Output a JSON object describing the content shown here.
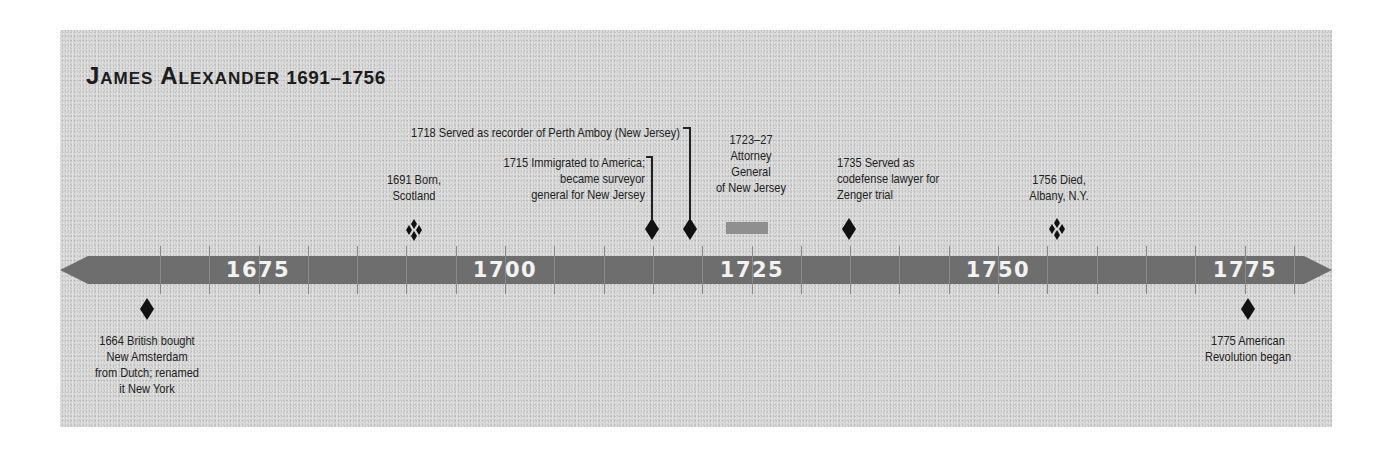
{
  "title": {
    "name": "James Alexander",
    "years": "1691–1756"
  },
  "axis": {
    "labels": [
      {
        "year": 1675,
        "text": "1675",
        "x": 258
      },
      {
        "year": 1700,
        "text": "1700",
        "x": 505
      },
      {
        "year": 1725,
        "text": "1725",
        "x": 752
      },
      {
        "year": 1750,
        "text": "1750",
        "x": 998
      },
      {
        "year": 1775,
        "text": "1775",
        "x": 1245
      }
    ],
    "tick_interval_years": 5,
    "bar_color": "#6e6e6e",
    "range": [
      1660,
      1780
    ]
  },
  "events": {
    "e1664": {
      "text_lines": [
        "1664 British bought",
        "New Amsterdam",
        "from Dutch; renamed",
        "it New York"
      ],
      "year": "1664",
      "marker": "diamond",
      "position": "below"
    },
    "e1691": {
      "text_lines": [
        "1691 Born,",
        "Scotland"
      ],
      "year": "1691",
      "marker": "diamond-cluster",
      "position": "above"
    },
    "e1715": {
      "text_lines": [
        "1715 Immigrated to America;",
        "became surveyor",
        "general for New Jersey"
      ],
      "year": "1715",
      "marker": "diamond",
      "position": "above"
    },
    "e1718": {
      "text_lines": [
        "1718 Served as recorder of Perth Amboy (New Jersey)"
      ],
      "year": "1718",
      "marker": "diamond",
      "position": "above"
    },
    "e1723": {
      "text_lines": [
        "1723–27",
        "Attorney",
        "General",
        "of New Jersey"
      ],
      "year": "1723–27",
      "marker": "span-bar",
      "position": "above"
    },
    "e1735": {
      "text_lines": [
        "1735 Served as",
        "codefense lawyer for",
        "Zenger trial"
      ],
      "year": "1735",
      "marker": "diamond",
      "position": "above"
    },
    "e1756": {
      "text_lines": [
        "1756 Died,",
        "Albany, N.Y."
      ],
      "year": "1756",
      "marker": "diamond-cluster",
      "position": "above"
    },
    "e1775": {
      "text_lines": [
        "1775 American",
        "Revolution began"
      ],
      "year": "1775",
      "marker": "diamond",
      "position": "below"
    }
  },
  "colors": {
    "panel": "#d4d4d4",
    "bar": "#6e6e6e",
    "bar_text": "#f2f2f2",
    "marker": "#111111",
    "span_bar": "#8f8f8f",
    "text": "#222222"
  }
}
